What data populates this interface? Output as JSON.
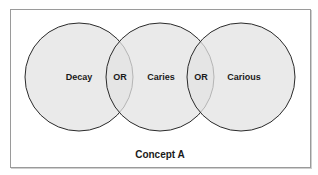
{
  "diagram": {
    "type": "venn",
    "caption": "Concept A",
    "circles": [
      {
        "label": "Decay"
      },
      {
        "label": "Caries"
      },
      {
        "label": "Carious"
      }
    ],
    "operators": [
      {
        "label": "OR"
      },
      {
        "label": "OR"
      }
    ],
    "colors": {
      "circle_fill": "#e3e3e3",
      "circle_stroke": "#2b2b2b",
      "frame_border": "#9a9a9a",
      "text": "#1a1a1a"
    }
  }
}
